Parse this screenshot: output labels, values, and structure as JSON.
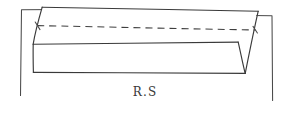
{
  "drawing": {
    "title": "hand-drawn beam elevation sketch",
    "background_color": "#ffffff",
    "stroke_color": "#3a3a3a",
    "width": 291,
    "height": 113,
    "caption": {
      "text": "R.S",
      "x": 145,
      "y": 96,
      "color": "#3a3a3a"
    },
    "labels": {
      "left_dimension": "",
      "right_dimension": ""
    },
    "geometry": {
      "top_face": {
        "name": "top-face-outline",
        "points": "42,7 258,11 245,44 33,44"
      },
      "front_face": {
        "name": "front-face-outline",
        "points": "33,44 238,42 245,73 33,72"
      },
      "hidden_edge": {
        "name": "hidden-center-line",
        "points": "38,26 255,30",
        "style": "dashed"
      },
      "left_bracket": {
        "name": "left-extension-bracket",
        "points": "62,10 20,10 20,95"
      },
      "right_bracket": {
        "name": "right-extension-bracket",
        "points": "252,16 272,16 272,100"
      },
      "left_slant_edge": {
        "name": "left-end-edge",
        "points": "42,7 33,44 33,72"
      },
      "right_slant_edge": {
        "name": "right-end-edge",
        "points": "258,11 245,73"
      },
      "right_notch": {
        "name": "right-v-notch",
        "points": "238,42 245,73"
      }
    }
  }
}
